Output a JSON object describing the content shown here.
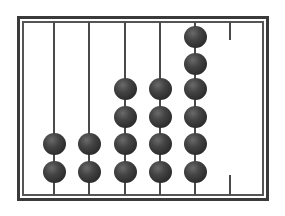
{
  "diagram": {
    "type": "abacus",
    "colors": {
      "frame": "#3a3a3a",
      "rod": "#4a4a4a",
      "bead": "#333333",
      "background": "#ffffff"
    },
    "rods": [
      {
        "index": 1,
        "beads": 2,
        "broken": false
      },
      {
        "index": 2,
        "beads": 2,
        "broken": false
      },
      {
        "index": 3,
        "beads": 4,
        "broken": false
      },
      {
        "index": 4,
        "beads": 4,
        "broken": false
      },
      {
        "index": 5,
        "beads": 6,
        "broken": false
      },
      {
        "index": 6,
        "beads": 0,
        "broken": true
      }
    ]
  }
}
